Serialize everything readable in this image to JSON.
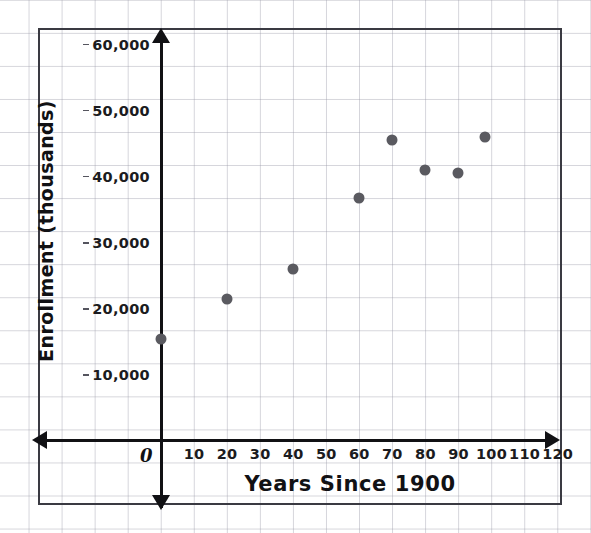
{
  "chart_data": {
    "type": "scatter",
    "title": "",
    "xlabel": "Years Since 1900",
    "ylabel": "Enrollment (thousands)",
    "xlim": [
      -10,
      130
    ],
    "ylim": [
      0,
      65000
    ],
    "xticks": [
      0,
      10,
      20,
      30,
      40,
      50,
      60,
      70,
      80,
      90,
      100,
      110,
      120
    ],
    "xtick_labels": [
      "0",
      "10",
      "20",
      "30",
      "40",
      "50",
      "60",
      "70",
      "80",
      "90",
      "100",
      "110",
      "120"
    ],
    "yticks": [
      10000,
      20000,
      30000,
      40000,
      50000,
      60000
    ],
    "ytick_labels": [
      "10,000",
      "20,000",
      "30,000",
      "40,000",
      "50,000",
      "60,000"
    ],
    "grid": true,
    "grid_color": "#96969f",
    "legend": null,
    "marker_color": "#5a5a60",
    "marker_size": 11,
    "x": [
      0,
      20,
      40,
      60,
      70,
      80,
      90,
      98
    ],
    "y": [
      15500,
      21500,
      26000,
      36800,
      45500,
      41000,
      40500,
      46000
    ],
    "points": [
      {
        "x": 0,
        "y": 15500,
        "label": "1900"
      },
      {
        "x": 20,
        "y": 21500,
        "label": "1920"
      },
      {
        "x": 40,
        "y": 26000,
        "label": "1940"
      },
      {
        "x": 60,
        "y": 36800,
        "label": "1960"
      },
      {
        "x": 70,
        "y": 45500,
        "label": "1970"
      },
      {
        "x": 80,
        "y": 41000,
        "label": "1980"
      },
      {
        "x": 90,
        "y": 40500,
        "label": "1990"
      },
      {
        "x": 98,
        "y": 46000,
        "label": "1998"
      }
    ]
  },
  "axes": {
    "origin_label": "0",
    "x_title": "Years Since 1900",
    "y_title": "Enrollment (thousands)"
  },
  "colors": {
    "marker": "#5a5a60",
    "axis": "#111114",
    "grid": "#96969f",
    "frame": "#3a3a42",
    "text": "#1b1b20"
  }
}
